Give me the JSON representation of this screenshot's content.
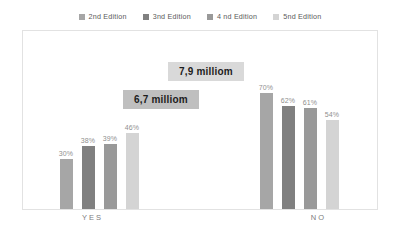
{
  "chart_data": {
    "type": "bar",
    "title": "",
    "subtitle": "",
    "xlabel": "",
    "ylabel": "",
    "ylim": [
      0,
      100
    ],
    "grid": false,
    "legend_position": "top-center",
    "categories": [
      "YES",
      "NO"
    ],
    "series": [
      {
        "name": "2nd Edition",
        "color": "#a6a6a6",
        "values": [
          30,
          70
        ],
        "labels": [
          "30%",
          "70%"
        ]
      },
      {
        "name": "3nd  Edition",
        "color": "#808080",
        "values": [
          38,
          62
        ],
        "labels": [
          "38%",
          "62%"
        ]
      },
      {
        "name": "4 nd Edition",
        "color": "#999999",
        "values": [
          39,
          61
        ],
        "labels": [
          "39%",
          "61%"
        ]
      },
      {
        "name": "5nd Edition",
        "color": "#d4d4d4",
        "values": [
          46,
          54
        ],
        "labels": [
          "46%",
          "54%"
        ]
      }
    ],
    "annotations": [
      {
        "text": "7,9 milliom",
        "background": "#d9d9d9",
        "position": "upper-center"
      },
      {
        "text": "6,7 milliom",
        "background": "#bfbfbf",
        "position": "center-left"
      }
    ]
  },
  "legend": {
    "items": [
      {
        "label": "2nd Edition",
        "color": "#a6a6a6"
      },
      {
        "label": "3nd  Edition",
        "color": "#808080"
      },
      {
        "label": "4 nd Edition",
        "color": "#999999"
      },
      {
        "label": "5nd Edition",
        "color": "#d4d4d4"
      }
    ]
  },
  "axis": {
    "categories": [
      {
        "label": "YES"
      },
      {
        "label": "NO"
      }
    ]
  },
  "colors": {
    "plot_border": "#e2e2e2",
    "value_label": "#8f8f8f",
    "axis_label": "#7d7d7d",
    "background": "#ffffff"
  }
}
